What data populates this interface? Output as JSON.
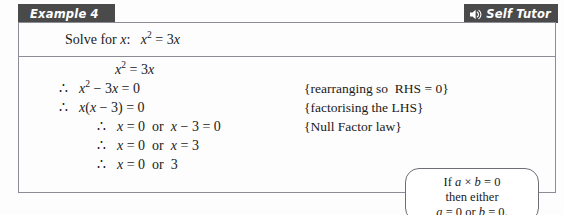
{
  "header": {
    "example_label": "Example 4",
    "self_tutor_label": "Self Tutor",
    "speaker_icon": "speaker-sound-icon",
    "bar_color": "#4a4a4a",
    "text_color": "#ffffff"
  },
  "question": {
    "prompt": "Solve for ",
    "variable": "x",
    "colon": ":",
    "equation_lhs": "x",
    "equation_exponent": "2",
    "equation_rhs": " = 3x",
    "full_text": "Solve for x:   x² = 3x"
  },
  "working": {
    "lines": [
      {
        "therefore": "",
        "equation": "x² = 3x",
        "note": ""
      },
      {
        "therefore": "∴",
        "equation": "x² − 3x = 0",
        "note": "{rearranging so  RHS = 0}"
      },
      {
        "therefore": "∴",
        "equation": "x(x − 3) = 0",
        "note": "{factorising the LHS}"
      },
      {
        "therefore": "∴",
        "equation": "x = 0  or  x − 3 = 0",
        "note": "{Null Factor law}"
      },
      {
        "therefore": "∴",
        "equation": "x = 0  or  x = 3",
        "note": ""
      },
      {
        "therefore": "∴",
        "equation": "x = 0  or  3",
        "note": ""
      }
    ]
  },
  "callout": {
    "line1": "If a × b = 0",
    "line2": "then either",
    "line3": "a = 0 or b = 0.",
    "border_color": "#6e6e78"
  },
  "colors": {
    "page_background": "#fdfdfd",
    "box_border": "#8c8c99",
    "text": "#1a1a1a"
  }
}
